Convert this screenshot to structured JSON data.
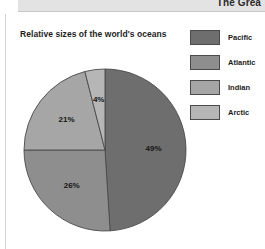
{
  "header": {
    "title": "The Grea"
  },
  "figure": {
    "title": "Relative sizes of the world's oceans"
  },
  "legend": {
    "items": [
      {
        "label": "Pacific",
        "color": "#6e6e6e"
      },
      {
        "label": "Atlantic",
        "color": "#8e8e8e"
      },
      {
        "label": "Indian",
        "color": "#a6a6a6"
      },
      {
        "label": "Arctic",
        "color": "#b6b6b6"
      }
    ]
  },
  "chart_data": {
    "type": "pie",
    "title": "Relative sizes of the world's oceans",
    "categories": [
      "Pacific",
      "Atlantic",
      "Indian",
      "Arctic"
    ],
    "values": [
      49,
      26,
      21,
      4
    ],
    "labels": [
      "49%",
      "26%",
      "21%",
      "4%"
    ],
    "colors": [
      "#6e6e6e",
      "#8e8e8e",
      "#a6a6a6",
      "#b6b6b6"
    ],
    "units": "percent",
    "total": 100,
    "start_angle_deg": 0,
    "direction": "clockwise",
    "legend_position": "right",
    "grid": false,
    "xlabel": "",
    "ylabel": ""
  }
}
